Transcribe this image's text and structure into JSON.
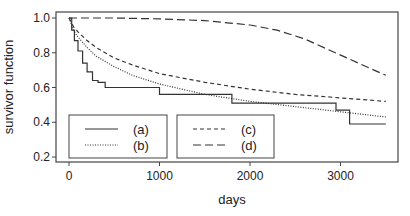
{
  "chart_data": {
    "type": "line",
    "title": "",
    "xlabel": "days",
    "ylabel": "survivor function",
    "xlim": [
      -150,
      3600
    ],
    "ylim": [
      0.18,
      1.03
    ],
    "xticks": [
      0,
      1000,
      2000,
      3000
    ],
    "xtick_labels": [
      "0",
      "1000",
      "2000",
      "3000"
    ],
    "yticks": [
      0.2,
      0.4,
      0.6,
      0.8,
      1.0
    ],
    "ytick_labels": [
      "0.2",
      "0.4",
      "0.6",
      "0.8",
      "1.0"
    ],
    "grid": false,
    "legend_position": "lower-left, two boxes",
    "series": [
      {
        "name": "(a)",
        "style": "solid-step",
        "x": [
          0,
          30,
          30,
          60,
          60,
          100,
          100,
          150,
          150,
          200,
          200,
          260,
          260,
          320,
          320,
          400,
          400,
          1000,
          1000,
          1800,
          1800,
          2950,
          2950,
          3100,
          3100,
          3500
        ],
        "y": [
          1.0,
          1.0,
          0.93,
          0.93,
          0.87,
          0.87,
          0.81,
          0.81,
          0.74,
          0.74,
          0.69,
          0.69,
          0.64,
          0.64,
          0.63,
          0.63,
          0.6,
          0.6,
          0.56,
          0.56,
          0.51,
          0.51,
          0.47,
          0.47,
          0.39,
          0.39
        ]
      },
      {
        "name": "(b)",
        "style": "dotted",
        "x": [
          0,
          50,
          100,
          200,
          300,
          500,
          700,
          1000,
          1500,
          2000,
          2500,
          3000,
          3500
        ],
        "y": [
          1.0,
          0.93,
          0.89,
          0.83,
          0.78,
          0.72,
          0.67,
          0.62,
          0.56,
          0.52,
          0.49,
          0.46,
          0.43
        ]
      },
      {
        "name": "(c)",
        "style": "short-dash",
        "x": [
          0,
          50,
          100,
          200,
          300,
          500,
          700,
          1000,
          1500,
          2000,
          2500,
          3000,
          3500
        ],
        "y": [
          1.0,
          0.95,
          0.92,
          0.87,
          0.83,
          0.77,
          0.73,
          0.68,
          0.63,
          0.59,
          0.56,
          0.54,
          0.52
        ]
      },
      {
        "name": "(d)",
        "style": "long-dash",
        "x": [
          0,
          500,
          1000,
          1500,
          2000,
          2300,
          2600,
          2900,
          3200,
          3500
        ],
        "y": [
          1.0,
          1.0,
          0.995,
          0.985,
          0.96,
          0.93,
          0.88,
          0.81,
          0.74,
          0.67
        ]
      }
    ]
  },
  "legend": {
    "box1": [
      {
        "label": "(a)",
        "style": "solid"
      },
      {
        "label": "(b)",
        "style": "dotted"
      }
    ],
    "box2": [
      {
        "label": "(c)",
        "style": "short-dash"
      },
      {
        "label": "(d)",
        "style": "long-dash"
      }
    ]
  },
  "colors": {
    "line": "#333333",
    "axis": "#444444",
    "background": "#ffffff"
  }
}
